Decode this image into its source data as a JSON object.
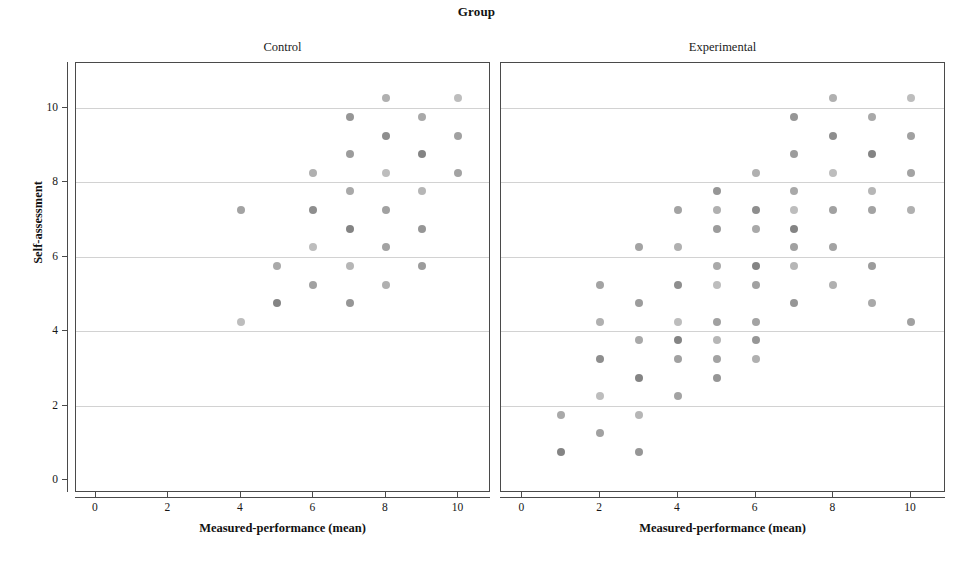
{
  "chart_data": {
    "type": "scatter",
    "title": "Group",
    "xlabel": "Measured-performance (mean)",
    "ylabel": "Self-assessment",
    "xlim": [
      -0.55,
      10.9
    ],
    "ylim": [
      -0.35,
      11.2
    ],
    "xticks": [
      0,
      2,
      4,
      6,
      8,
      10
    ],
    "yticks": [
      0,
      2,
      4,
      6,
      8,
      10
    ],
    "grid": "horizontal",
    "legend": "none",
    "panel_variable": "Group",
    "panels": [
      {
        "label": "Control",
        "xlabel": "Measured-performance (mean)",
        "points": [
          {
            "x": 4.0,
            "y": 7.25
          },
          {
            "x": 4.0,
            "y": 4.25
          },
          {
            "x": 5.0,
            "y": 5.75
          },
          {
            "x": 5.0,
            "y": 4.75
          },
          {
            "x": 6.0,
            "y": 8.25
          },
          {
            "x": 6.0,
            "y": 7.25
          },
          {
            "x": 6.0,
            "y": 6.25
          },
          {
            "x": 6.0,
            "y": 5.25
          },
          {
            "x": 7.0,
            "y": 9.75
          },
          {
            "x": 7.0,
            "y": 8.75
          },
          {
            "x": 7.0,
            "y": 7.75
          },
          {
            "x": 7.0,
            "y": 6.75
          },
          {
            "x": 7.0,
            "y": 5.75
          },
          {
            "x": 7.0,
            "y": 4.75
          },
          {
            "x": 8.0,
            "y": 10.25
          },
          {
            "x": 8.0,
            "y": 9.25
          },
          {
            "x": 8.0,
            "y": 8.25
          },
          {
            "x": 8.0,
            "y": 7.25
          },
          {
            "x": 8.0,
            "y": 6.25
          },
          {
            "x": 8.0,
            "y": 5.25
          },
          {
            "x": 9.0,
            "y": 9.75
          },
          {
            "x": 9.0,
            "y": 8.75
          },
          {
            "x": 9.0,
            "y": 7.75
          },
          {
            "x": 9.0,
            "y": 6.75
          },
          {
            "x": 9.0,
            "y": 5.75
          },
          {
            "x": 10.0,
            "y": 10.25
          },
          {
            "x": 10.0,
            "y": 9.25
          },
          {
            "x": 10.0,
            "y": 8.25
          }
        ]
      },
      {
        "label": "Experimental",
        "xlabel": "Measured-performance (mean)",
        "points": [
          {
            "x": 1.0,
            "y": 1.75
          },
          {
            "x": 1.0,
            "y": 0.75
          },
          {
            "x": 2.0,
            "y": 5.25
          },
          {
            "x": 2.0,
            "y": 4.25
          },
          {
            "x": 2.0,
            "y": 3.25
          },
          {
            "x": 2.0,
            "y": 2.25
          },
          {
            "x": 2.0,
            "y": 1.25
          },
          {
            "x": 3.0,
            "y": 6.25
          },
          {
            "x": 3.0,
            "y": 4.75
          },
          {
            "x": 3.0,
            "y": 3.75
          },
          {
            "x": 3.0,
            "y": 2.75
          },
          {
            "x": 3.0,
            "y": 1.75
          },
          {
            "x": 3.0,
            "y": 0.75
          },
          {
            "x": 4.0,
            "y": 7.25
          },
          {
            "x": 4.0,
            "y": 6.25
          },
          {
            "x": 4.0,
            "y": 5.25
          },
          {
            "x": 4.0,
            "y": 4.25
          },
          {
            "x": 4.0,
            "y": 3.75
          },
          {
            "x": 4.0,
            "y": 3.25
          },
          {
            "x": 4.0,
            "y": 2.25
          },
          {
            "x": 5.0,
            "y": 7.75
          },
          {
            "x": 5.0,
            "y": 7.25
          },
          {
            "x": 5.0,
            "y": 6.75
          },
          {
            "x": 5.0,
            "y": 5.75
          },
          {
            "x": 5.0,
            "y": 5.25
          },
          {
            "x": 5.0,
            "y": 4.25
          },
          {
            "x": 5.0,
            "y": 3.75
          },
          {
            "x": 5.0,
            "y": 3.25
          },
          {
            "x": 5.0,
            "y": 2.75
          },
          {
            "x": 6.0,
            "y": 8.25
          },
          {
            "x": 6.0,
            "y": 7.25
          },
          {
            "x": 6.0,
            "y": 6.75
          },
          {
            "x": 6.0,
            "y": 5.75
          },
          {
            "x": 6.0,
            "y": 5.25
          },
          {
            "x": 6.0,
            "y": 4.25
          },
          {
            "x": 6.0,
            "y": 3.75
          },
          {
            "x": 6.0,
            "y": 3.25
          },
          {
            "x": 7.0,
            "y": 9.75
          },
          {
            "x": 7.0,
            "y": 8.75
          },
          {
            "x": 7.0,
            "y": 7.75
          },
          {
            "x": 7.0,
            "y": 7.25
          },
          {
            "x": 7.0,
            "y": 6.75
          },
          {
            "x": 7.0,
            "y": 6.25
          },
          {
            "x": 7.0,
            "y": 5.75
          },
          {
            "x": 7.0,
            "y": 4.75
          },
          {
            "x": 8.0,
            "y": 10.25
          },
          {
            "x": 8.0,
            "y": 9.25
          },
          {
            "x": 8.0,
            "y": 8.25
          },
          {
            "x": 8.0,
            "y": 7.25
          },
          {
            "x": 8.0,
            "y": 6.25
          },
          {
            "x": 8.0,
            "y": 5.25
          },
          {
            "x": 9.0,
            "y": 9.75
          },
          {
            "x": 9.0,
            "y": 8.75
          },
          {
            "x": 9.0,
            "y": 7.75
          },
          {
            "x": 9.0,
            "y": 7.25
          },
          {
            "x": 9.0,
            "y": 5.75
          },
          {
            "x": 9.0,
            "y": 4.75
          },
          {
            "x": 10.0,
            "y": 10.25
          },
          {
            "x": 10.0,
            "y": 9.25
          },
          {
            "x": 10.0,
            "y": 8.25
          },
          {
            "x": 10.0,
            "y": 7.25
          },
          {
            "x": 10.0,
            "y": 4.25
          }
        ]
      }
    ]
  },
  "style": {
    "point_color": "#9a9a9a",
    "point_color_dark": "#6e6e6e",
    "axis_color": "#4a4a4a",
    "grid_color": "#d2d2d2",
    "background": "#ffffff"
  }
}
